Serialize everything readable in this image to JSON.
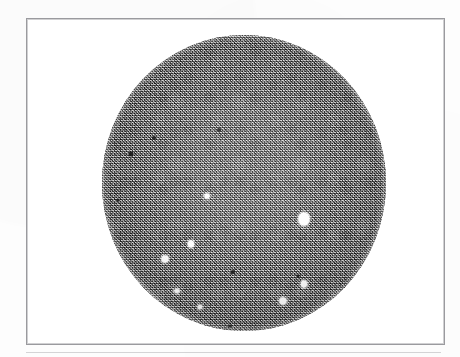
{
  "figure": {
    "kind": "photomicrograph-plate",
    "caption": "",
    "frame": {
      "x": 26,
      "y": 18,
      "width": 419,
      "height": 327,
      "border_color": "#9a9a9e",
      "border_width_px": 1,
      "background_color": "#ffffff"
    },
    "page": {
      "background_color": "#fdfdfd",
      "width": 460,
      "height": 357
    },
    "scan_rule": {
      "x": 26,
      "y": 352,
      "width": 415,
      "color": "#96969c"
    }
  },
  "field_of_view": {
    "shape": "circle",
    "center_x": 243,
    "center_y": 182,
    "radius_x": 142,
    "radius_y": 148,
    "base_gray": "#8e8e8e",
    "texture": "fine granular salt-and-pepper emulsion grain",
    "rim": "soft darker vignette toward aperture edge"
  },
  "particles": [
    {
      "id": "bright-1",
      "type": "bright",
      "x": 303,
      "y": 218,
      "w": 11,
      "h": 13,
      "note": "largest bright inclusion, right of centre"
    },
    {
      "id": "bright-2",
      "type": "bright",
      "x": 190,
      "y": 243,
      "w": 6,
      "h": 7,
      "note": "small bright speck, left-lower field"
    },
    {
      "id": "bright-3",
      "type": "bright",
      "x": 164,
      "y": 258,
      "w": 7,
      "h": 7,
      "note": "bright speck, lower-left field"
    },
    {
      "id": "bright-4",
      "type": "bright",
      "x": 303,
      "y": 283,
      "w": 6,
      "h": 7,
      "note": "bright speck, lower-right field"
    },
    {
      "id": "bright-5",
      "type": "bright",
      "x": 282,
      "y": 300,
      "w": 7,
      "h": 7,
      "note": "bright speck near lower rim"
    },
    {
      "id": "bright-6",
      "type": "bright",
      "x": 206,
      "y": 195,
      "w": 5,
      "h": 5,
      "note": "faint bright speck, centre-left"
    },
    {
      "id": "bright-7",
      "type": "bright",
      "x": 176,
      "y": 290,
      "w": 5,
      "h": 4,
      "note": "elongated bright fleck, lower-left"
    },
    {
      "id": "bright-8",
      "type": "bright",
      "x": 199,
      "y": 306,
      "w": 4,
      "h": 4,
      "note": "small fleck near bottom rim"
    },
    {
      "id": "dark-1",
      "type": "dark",
      "x": 130,
      "y": 153,
      "w": 5,
      "h": 5,
      "note": "dark speck, upper-left field"
    },
    {
      "id": "dark-2",
      "type": "dark",
      "x": 153,
      "y": 137,
      "w": 4,
      "h": 4,
      "note": "dark speck, upper-left field"
    },
    {
      "id": "dark-3",
      "type": "dark",
      "x": 218,
      "y": 129,
      "w": 4,
      "h": 4,
      "note": "dark speck, upper-centre field"
    },
    {
      "id": "dark-4",
      "type": "dark",
      "x": 232,
      "y": 271,
      "w": 4,
      "h": 4,
      "note": "dark speck, lower-centre field"
    },
    {
      "id": "dark-5",
      "type": "dark",
      "x": 229,
      "y": 325,
      "w": 4,
      "h": 3,
      "note": "dark speck at bottom rim"
    },
    {
      "id": "dark-6",
      "type": "dark",
      "x": 297,
      "y": 275,
      "w": 3,
      "h": 3,
      "note": "dark speck, right-lower field"
    },
    {
      "id": "dark-7",
      "type": "dark",
      "x": 117,
      "y": 199,
      "w": 3,
      "h": 3,
      "note": "dark speck near left rim"
    }
  ]
}
